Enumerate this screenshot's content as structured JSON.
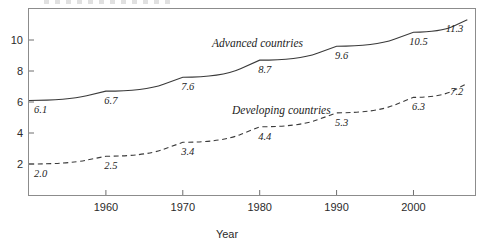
{
  "chart_data": {
    "type": "line",
    "title": "",
    "xlabel": "Year",
    "ylabel": "",
    "xlim": [
      1950,
      2008
    ],
    "ylim": [
      0,
      12
    ],
    "grid": false,
    "legend_position": "inline-annotation",
    "x_ticks": [
      1960,
      1970,
      1980,
      1990,
      2000
    ],
    "y_ticks": [
      2,
      4,
      6,
      8,
      10
    ],
    "series": [
      {
        "name": "Advanced countries",
        "style": "solid",
        "x": [
          1950,
          1960,
          1970,
          1980,
          1990,
          2000,
          2007
        ],
        "values": [
          6.1,
          6.7,
          7.6,
          8.7,
          9.6,
          10.5,
          11.3
        ],
        "labels": [
          "6.1",
          "6.7",
          "7.6",
          "8.7",
          "9.6",
          "10.5",
          "11.3"
        ]
      },
      {
        "name": "Developing countries",
        "style": "dashed",
        "x": [
          1950,
          1960,
          1970,
          1980,
          1990,
          2000,
          2007
        ],
        "values": [
          2.0,
          2.5,
          3.4,
          4.4,
          5.3,
          6.3,
          7.2
        ],
        "labels": [
          "2.0",
          "2.5",
          "3.4",
          "4.4",
          "5.3",
          "6.3",
          "7.2"
        ]
      }
    ]
  },
  "axis": {
    "x_title": "Year",
    "x_tick_labels": [
      "1960",
      "1970",
      "1980",
      "1990",
      "2000"
    ],
    "y_tick_labels": [
      "2",
      "4",
      "6",
      "8",
      "10"
    ]
  },
  "annotations": {
    "advanced_label": "Advanced countries",
    "developing_label": "Developing countries"
  },
  "colors": {
    "line": "#3a3a3a",
    "frame": "#8c8c8c",
    "text": "#1d1d1d"
  }
}
